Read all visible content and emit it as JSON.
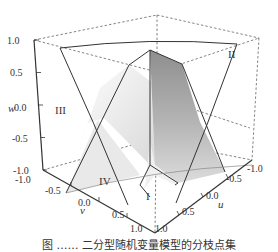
{
  "figure": {
    "type": "3d-surface-plot",
    "axes": {
      "w": {
        "label": "w",
        "ticks": [
          "1.0",
          "0.5",
          "0.0",
          "-0.5",
          "-1.0"
        ]
      },
      "v": {
        "label": "v",
        "ticks": [
          "-1.0",
          "-0.5",
          "0.0",
          "0.5",
          "1.0"
        ]
      },
      "u": {
        "label": "u",
        "ticks": [
          "1.0",
          "0.5",
          "0.0",
          "-0.5",
          "-1.0"
        ]
      }
    },
    "regions": [
      "I",
      "II",
      "III",
      "IV"
    ],
    "colors": {
      "box_dashed": "#666666",
      "surface_dark": "#9a9a9a",
      "surface_light": "#e6e6e6",
      "line": "#333333"
    }
  },
  "caption": "图 ……  二分型随机变量模型的分枝点集"
}
